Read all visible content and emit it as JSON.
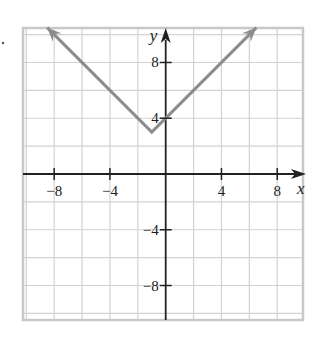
{
  "chart_data": {
    "type": "line",
    "title": "",
    "function": "y = |x + 1| + 3",
    "xlabel": "x",
    "ylabel": "y",
    "xlim": [
      -10.25,
      9.85
    ],
    "ylim": [
      -10.5,
      10.5
    ],
    "grid": true,
    "grid_step": 2,
    "x_ticks": [
      -8,
      -4,
      4,
      8
    ],
    "y_ticks": [
      8,
      4,
      -4,
      -8
    ],
    "x_tick_labels": [
      "−8",
      "−4",
      "4",
      "8"
    ],
    "y_tick_labels": [
      "8",
      "4",
      "−4",
      "−8"
    ],
    "series": [
      {
        "name": "y = |x + 1| + 3",
        "x": [
          -8.5,
          -1,
          6.5
        ],
        "y": [
          10.5,
          3,
          10.5
        ],
        "arrows_at_ends": true,
        "color": "#8c8c8c"
      }
    ],
    "vertex": [
      -1,
      3
    ],
    "legend": null
  },
  "colors": {
    "grid": "#d2d2d2",
    "frame": "#c8c8c8",
    "axes": "#222222",
    "curve": "#8c8c8c"
  }
}
